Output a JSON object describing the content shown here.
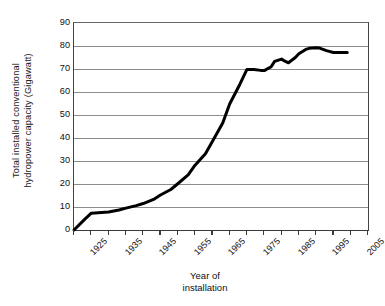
{
  "chart_data": {
    "type": "line",
    "title": "",
    "xlabel": "Year of installation",
    "ylabel": "Total installed conventional hydropower capacity (Gigawatt)",
    "ylabel_line1": "Total installed conventional",
    "ylabel_line2": "hydropower capacity (Gigawatt)",
    "xlabel_line1": "Year of",
    "xlabel_line2": "installation",
    "xlim": [
      1925,
      2010
    ],
    "ylim": [
      0,
      90
    ],
    "y_ticks": [
      0,
      10,
      20,
      30,
      40,
      50,
      60,
      70,
      80,
      90
    ],
    "y_tick_labels": [
      "0",
      "10",
      "20",
      "30",
      "40",
      "50",
      "60",
      "70",
      "80",
      "90"
    ],
    "x_ticks_major": [
      1925,
      1935,
      1945,
      1955,
      1965,
      1975,
      1985,
      1995,
      2005
    ],
    "x_tick_labels": [
      "1925",
      "1935",
      "1945",
      "1955",
      "1965",
      "1975",
      "1985",
      "1995",
      "2005"
    ],
    "x_ticks_minor": [
      1930,
      1940,
      1950,
      1960,
      1970,
      1980,
      1990,
      2000,
      2010
    ],
    "grid": "horizontal",
    "legend": "none",
    "line_color": "#000000",
    "grid_color": "#8c8c8c",
    "axis_color": "#3a3a3a",
    "series": [
      {
        "name": "Total installed conventional hydropower capacity",
        "units": "Gigawatt",
        "x": [
          1925,
          1928,
          1930,
          1932,
          1935,
          1938,
          1940,
          1943,
          1945,
          1948,
          1950,
          1953,
          1955,
          1958,
          1960,
          1963,
          1965,
          1968,
          1970,
          1973,
          1975,
          1977,
          1979,
          1980,
          1982,
          1983,
          1985,
          1986,
          1987,
          1989,
          1990,
          1992,
          1993,
          1995,
          1996,
          1998,
          2000,
          2002,
          2004
        ],
        "values": [
          0,
          4.5,
          7.3,
          7.5,
          7.8,
          8.7,
          9.5,
          10.6,
          11.5,
          13.3,
          15.2,
          17.6,
          20.1,
          24.0,
          28.2,
          33.2,
          38.5,
          46.5,
          54.8,
          63.5,
          69.8,
          69.8,
          69.4,
          69.3,
          71.0,
          73.3,
          74.3,
          73.4,
          72.7,
          75.0,
          76.6,
          78.5,
          79.0,
          79.2,
          79.1,
          78.0,
          77.2,
          77.2,
          77.2
        ]
      }
    ]
  }
}
